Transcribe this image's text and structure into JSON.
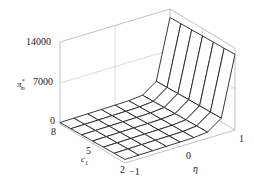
{
  "chart_data": {
    "type": "surface3d",
    "title": "",
    "zlabel": "π*_m",
    "xlabel": "c1",
    "ylabel": "η",
    "z_ticks": [
      "0",
      "7000",
      "14000"
    ],
    "x_ticks": [
      "8",
      "5",
      "2"
    ],
    "y_ticks": [
      "-1",
      "0",
      "1"
    ],
    "xlim": [
      2,
      8
    ],
    "ylim": [
      -1,
      1
    ],
    "zlim": [
      0,
      14000
    ],
    "grid_lines": {
      "c1_count": 7,
      "eta_count": 9
    },
    "surface_description": "Surface rises steeply as η approaches 1 and c1 approaches 2, reaching ~12000 at (c1=2..8, η=1); near zero for η ≤ 0.",
    "sample_points": [
      {
        "c1": 8,
        "eta": -1,
        "z": 300
      },
      {
        "c1": 2,
        "eta": -1,
        "z": 300
      },
      {
        "c1": 8,
        "eta": 0,
        "z": 600
      },
      {
        "c1": 2,
        "eta": 0,
        "z": 900
      },
      {
        "c1": 8,
        "eta": 0.75,
        "z": 3500
      },
      {
        "c1": 2,
        "eta": 0.75,
        "z": 4000
      },
      {
        "c1": 8,
        "eta": 1,
        "z": 12500
      },
      {
        "c1": 2,
        "eta": 1,
        "z": 12500
      }
    ]
  },
  "labels": {
    "z_axis_label": "π",
    "z_axis_sub": "m",
    "z_axis_sup": "*",
    "x_axis_label": "c",
    "x_axis_sub": "1",
    "y_axis_label": "η",
    "z_tick_0": "0",
    "z_tick_7000": "7000",
    "z_tick_14000": "14000",
    "x_tick_8": "8",
    "x_tick_5": "5",
    "x_tick_2": "2",
    "y_tick_m1": "−1",
    "y_tick_0": "0",
    "y_tick_1": "1"
  },
  "colors": {
    "axis": "#999999",
    "grid": "#b5b5b5",
    "surface_line": "#222222",
    "surface_fill": "#ffffff"
  }
}
